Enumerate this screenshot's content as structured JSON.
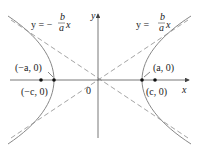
{
  "diagram": {
    "axes": {
      "x_label": "x",
      "y_label": "y",
      "origin_label": "0"
    },
    "asymptotes": [
      {
        "label_left": "y = −",
        "frac_num": "b",
        "frac_den": "a",
        "var": "x"
      },
      {
        "label_left": "y = ",
        "frac_num": "b",
        "frac_den": "a",
        "var": "x"
      }
    ],
    "points": {
      "neg_vertex": "(−a, 0)",
      "pos_vertex": "(a, 0)",
      "neg_focus": "(−c, 0)",
      "pos_focus": "(c, 0)"
    },
    "colors": {
      "curve": "#888888",
      "axis": "#555555",
      "dash": "#999999",
      "point": "#111111"
    }
  }
}
